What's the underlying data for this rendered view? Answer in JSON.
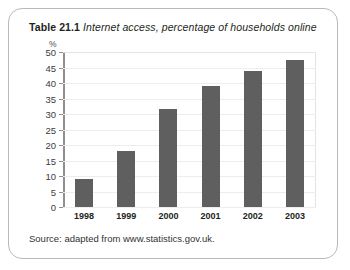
{
  "figure": {
    "caption_label": "Table 21.1",
    "caption_text": "Internet access, percentage of households online",
    "source": "Source: adapted from www.statistics.gov.uk.",
    "bar_color": "#5f5f5f",
    "frame_color": "#b9b9b9",
    "gridline_color": "#ededed",
    "axis_color": "#8f8f8f"
  },
  "chart_data": {
    "type": "bar",
    "title": "Internet access, percentage of households online",
    "xlabel": "",
    "ylabel": "%",
    "categories": [
      "1998",
      "1999",
      "2000",
      "2001",
      "2002",
      "2003"
    ],
    "values": [
      9,
      18,
      31.5,
      39,
      44,
      47.5
    ],
    "ylim": [
      0,
      50
    ],
    "ytick_step": 5,
    "yticks": [
      50,
      45,
      40,
      35,
      30,
      25,
      20,
      15,
      10,
      5,
      0
    ],
    "ytick_labels": [
      "50",
      "45",
      "40",
      "35",
      "30",
      "25",
      "20",
      "15",
      "10",
      "5",
      "0"
    ],
    "grid": true,
    "legend": false,
    "series": [
      {
        "name": "Percentage of households online",
        "values": [
          9,
          18,
          31.5,
          39,
          44,
          47.5
        ]
      }
    ]
  }
}
